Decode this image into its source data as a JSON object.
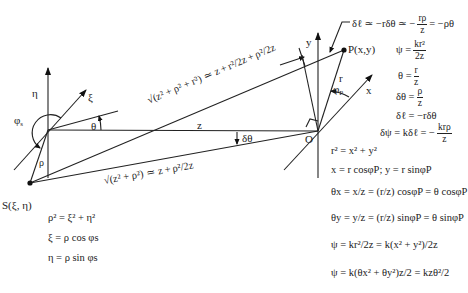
{
  "figure": {
    "type": "geometry-diagram"
  },
  "labels": {
    "eta_axis": "η",
    "xi_axis": "ξ",
    "phi_s": "φ",
    "phi_s_sub": "s",
    "rho": "ρ",
    "theta": "θ",
    "z": "z",
    "delta_theta": "δθ",
    "source_point": "S(ξ, η)",
    "origin": "O",
    "y_axis": "y",
    "x_axis": "x",
    "r": "r",
    "phi_p": "φ",
    "phi_p_sub": "P",
    "observation_point": "P(x,y)"
  },
  "annotations": {
    "upper_path": {
      "lhs": "√(z² + ρ² + r²)",
      "approx": "≃",
      "terms": [
        "z",
        "+",
        "r²/2z",
        "+",
        "ρ²/2z"
      ]
    },
    "lower_path": {
      "lhs": "√(z² + ρ²)",
      "approx": "≃",
      "terms": [
        "z",
        "+",
        "ρ²/2z"
      ]
    },
    "delta_ell_top": {
      "text_a": "δℓ ≃ −rδθ ≃ −",
      "num": "rρ",
      "den": "z",
      "text_b": "= −ρθ"
    }
  },
  "equations_right": [
    {
      "lhs": "ψ =",
      "num": "kr²",
      "den": "2z"
    },
    {
      "lhs": "θ =",
      "num": "r",
      "den": "z"
    },
    {
      "lhs": "δθ =",
      "num": "ρ",
      "den": "z"
    },
    {
      "lhs": "δℓ = −rδθ"
    },
    {
      "lhs": "δψ = kδℓ = −",
      "num": "krρ",
      "den": "z"
    }
  ],
  "equations_lower_right": [
    "r² = x² + y²",
    "x = r cosφP; y = r sinφP",
    "θx = x/z = (r/z) cosφP = θ cosφP",
    "θy = y/z = (r/z) sinφP = θ sinφP",
    "ψ = kr²/2z = k(x² + y²)/2z",
    "ψ = k(θx² + θy²)z/2 = kzθ²/2"
  ],
  "equations_lower_left": [
    "ρ² = ξ² + η²",
    "ξ = ρ cos φs",
    "η = ρ sin φs"
  ]
}
